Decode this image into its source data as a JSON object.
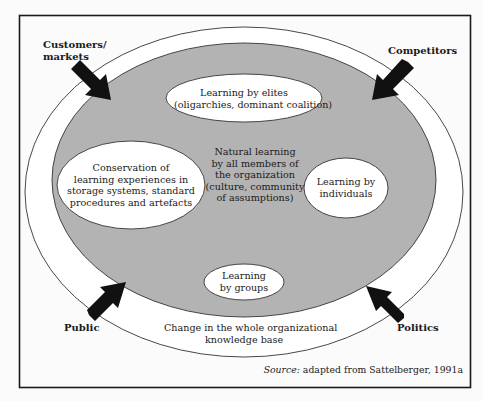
{
  "colors": {
    "background": "#fbfbfb",
    "frame": "#1a1a1a",
    "outer_ellipse_fill": "#ffffff",
    "inner_ellipse_fill": "#b3b3b3",
    "bubble_fill": "#ffffff",
    "arrow": "#111111"
  },
  "external_forces": {
    "top_left": [
      "Customers/",
      "markets"
    ],
    "top_right": "Competitors",
    "bottom_left": "Public",
    "bottom_right": "Politics"
  },
  "bubbles": {
    "elites": [
      "Learning by elites",
      "(oligarchies, dominant coalition)"
    ],
    "conservation": [
      "Conservation of",
      "learning experiences in",
      "storage  systems, standard",
      "procedures and artefacts"
    ],
    "individuals": [
      "Learning by",
      "individuals"
    ],
    "groups": [
      "Learning",
      "by groups"
    ]
  },
  "center_text": [
    "Natural learning",
    "by all members of",
    "the organization",
    "(culture, community",
    "of assumptions)"
  ],
  "outer_ring_text": [
    "Change in the whole organizational",
    "knowledge base"
  ],
  "source": {
    "prefix": "Source:",
    "text": " adapted from Sattelberger, 1991a"
  }
}
